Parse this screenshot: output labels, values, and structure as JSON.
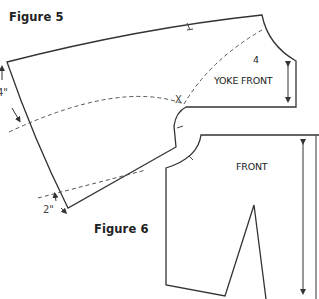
{
  "figures": [
    {
      "id": "figure5",
      "label": "Figure 5"
    },
    {
      "id": "figure6",
      "label": "Figure 6"
    }
  ],
  "pieces": {
    "yoke_front": {
      "label": "YOKE FRONT",
      "number": "4"
    },
    "front": {
      "label": "FRONT"
    }
  },
  "marks": {
    "x_mark": "X",
    "dim_top": "4\"",
    "dim_bottom": "2\""
  },
  "colors": {
    "line": "#333333",
    "dash": "#555555",
    "text": "#222222"
  }
}
